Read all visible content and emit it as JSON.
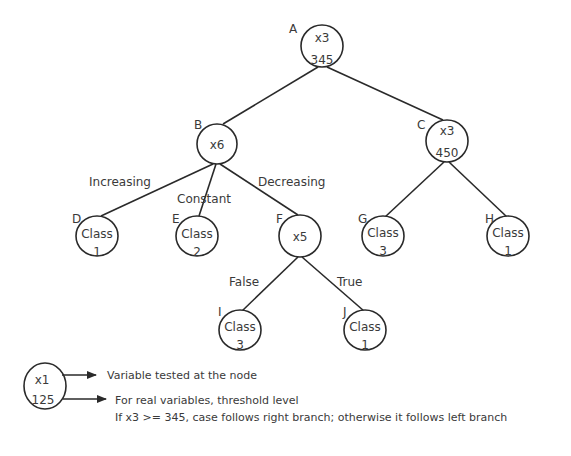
{
  "diagram": {
    "type": "decision-tree",
    "nodes": {
      "A": {
        "letter": "A",
        "line1": "x3",
        "line2": "345"
      },
      "B": {
        "letter": "B",
        "line1": "x6",
        "line2": ""
      },
      "C": {
        "letter": "C",
        "line1": "x3",
        "line2": "450"
      },
      "D": {
        "letter": "D",
        "line1": "Class",
        "line2": "1"
      },
      "E": {
        "letter": "E",
        "line1": "Class",
        "line2": "2"
      },
      "F": {
        "letter": "F",
        "line1": "x5",
        "line2": ""
      },
      "G": {
        "letter": "G",
        "line1": "Class",
        "line2": "3"
      },
      "H": {
        "letter": "H",
        "line1": "Class",
        "line2": "1"
      },
      "I": {
        "letter": "I",
        "line1": "Class",
        "line2": "3"
      },
      "J": {
        "letter": "J",
        "line1": "Class",
        "line2": "1"
      }
    },
    "edges": [
      {
        "from": "A",
        "to": "B",
        "label": ""
      },
      {
        "from": "A",
        "to": "C",
        "label": ""
      },
      {
        "from": "B",
        "to": "D",
        "label": "Increasing"
      },
      {
        "from": "B",
        "to": "E",
        "label": "Constant"
      },
      {
        "from": "B",
        "to": "F",
        "label": "Decreasing"
      },
      {
        "from": "C",
        "to": "G",
        "label": ""
      },
      {
        "from": "C",
        "to": "H",
        "label": ""
      },
      {
        "from": "F",
        "to": "I",
        "label": "False"
      },
      {
        "from": "F",
        "to": "J",
        "label": "True"
      }
    ],
    "edge_labels": {
      "increasing": "Increasing",
      "constant": "Constant",
      "decreasing": "Decreasing",
      "false": "False",
      "true": "True"
    }
  },
  "legend": {
    "node_line1": "x1",
    "node_line2": "125",
    "variable_desc": "Variable tested at the node",
    "threshold_desc": "For real variables, threshold level",
    "rule_desc": "If x3 >= 345, case follows right branch; otherwise it follows left branch"
  }
}
